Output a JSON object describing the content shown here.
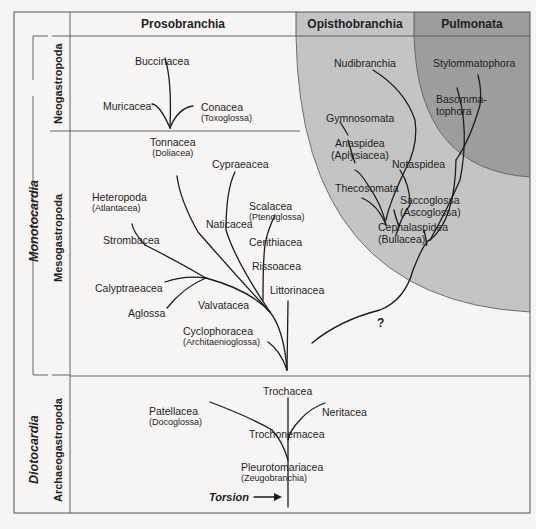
{
  "columns": {
    "prosobranchia": "Prosobranchia",
    "opisthobranchia": "Opisthobranchia",
    "pulmonata": "Pulmonata"
  },
  "rows": {
    "monotocardia": "Monotocardia",
    "diotocardia": "Diotocardia",
    "neogastropoda": "Neogastropoda",
    "mesogastropoda": "Mesogastropoda",
    "archaeogastropoda": "Archaeogastropoda"
  },
  "taxa": {
    "buccinacea": "Buccinacea",
    "muricacea": "Muricacea",
    "conacea": "Conacea",
    "conacea_alt": "(Toxoglossa)",
    "tonnacea": "Tonnacea",
    "tonnacea_alt": "(Doliacea)",
    "cypraeacea": "Cypraeacea",
    "heteropoda": "Heteropoda",
    "heteropoda_alt": "(Atlantacea)",
    "naticacea": "Naticacea",
    "scalacea": "Scalacea",
    "scalacea_alt": "(Ptenoglossa)",
    "strombacea": "Strombacea",
    "cerithiacea": "Cerithiacea",
    "rissoacea": "Rissoacea",
    "calyptraeacea": "Calyptraeacea",
    "littorinacea": "Littorinacea",
    "valvatacea": "Valvatacea",
    "aglossa": "Aglossa",
    "cyclophoracea": "Cyclophoracea",
    "cyclophoracea_alt": "(Architaenioglossa)",
    "nudibranchia": "Nudibranchia",
    "stylommatophora": "Stylommatophora",
    "basommatophora_1": "Basomma-",
    "basommatophora_2": "tophora",
    "gymnosomata": "Gymnosomata",
    "anaspidea": "Anaspidea",
    "anaspidea_alt": "(Aplysiacea)",
    "notaspidea": "Notaspidea",
    "thecosomata": "Thecosomata",
    "saccoglossa": "Saccoglossa",
    "saccoglossa_alt": "(Ascoglossa)",
    "cephalaspidea": "Cephalaspidea",
    "cephalaspidea_alt": "(Bullacea)",
    "trochacea": "Trochacea",
    "patellacea": "Patellacea",
    "patellacea_alt": "(Docoglossa)",
    "neritacea": "Neritacea",
    "trochonemacea": "Trochonemacea",
    "pleurotomariacea": "Pleurotomariacea",
    "pleurotomariacea_alt": "(Zeugobranchia)"
  },
  "annotations": {
    "uncertain": "?",
    "torsion": "Torsion"
  },
  "colors": {
    "background": "#f6f5f3",
    "opisthobranchia_fill": "#c4c4c4",
    "pulmonata_fill": "#9d9d9d",
    "line": "#1c1c1c",
    "frame": "#555555"
  }
}
